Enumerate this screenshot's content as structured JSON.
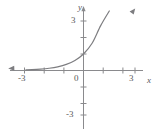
{
  "figure": {
    "name": "exponential-growth-graph",
    "background_color": "#ffffff",
    "curve_color": "#7d7d80",
    "axis_color": "#8a8a8d",
    "text_color": "#58585a"
  },
  "axes": {
    "x_axis_label": "x",
    "y_axis_label": "y",
    "origin_label": "0",
    "x_ticks": [
      {
        "value": -3,
        "label": "-3",
        "labeled": true
      },
      {
        "value": -2,
        "label": "",
        "labeled": false
      },
      {
        "value": -1,
        "label": "",
        "labeled": false
      },
      {
        "value": 1,
        "label": "",
        "labeled": false
      },
      {
        "value": 2,
        "label": "",
        "labeled": false
      },
      {
        "value": 3,
        "label": "3",
        "labeled": true
      }
    ],
    "y_ticks": [
      {
        "value": 3,
        "label": "3",
        "labeled": true
      },
      {
        "value": 2,
        "label": "",
        "labeled": false
      },
      {
        "value": 1,
        "label": "",
        "labeled": false
      },
      {
        "value": -1,
        "label": "",
        "labeled": false
      },
      {
        "value": -2,
        "label": "",
        "labeled": false
      },
      {
        "value": -3,
        "label": "-3",
        "labeled": true
      }
    ]
  },
  "chart_data": {
    "type": "line",
    "title": "",
    "subtitle": "",
    "xlabel": "x",
    "ylabel": "y",
    "xlim": [
      -3.6,
      3.6
    ],
    "ylim": [
      -3.6,
      3.6
    ],
    "grid": false,
    "legend": null,
    "xticks": [
      -3,
      -2,
      -1,
      0,
      1,
      2,
      3
    ],
    "xticklabels": [
      "-3",
      "",
      "",
      "0",
      "",
      "",
      "3"
    ],
    "yticks": [
      -3,
      -2,
      -1,
      0,
      1,
      2,
      3
    ],
    "yticklabels": [
      "-3",
      "",
      "",
      "0",
      "",
      "",
      "3"
    ],
    "series": [
      {
        "name": "y = e^x",
        "color": "#7d7d80",
        "line_width": 1.2,
        "arrow_start": true,
        "arrow_end": true,
        "x": [
          -3.35,
          -3.0,
          -2.5,
          -2.0,
          -1.5,
          -1.0,
          -0.5,
          0.0,
          0.5,
          1.0,
          1.5,
          2.0,
          2.25
        ],
        "y": [
          0.035,
          0.05,
          0.082,
          0.135,
          0.223,
          0.368,
          0.607,
          1.0,
          1.649,
          2.718,
          4.48,
          7.39,
          9.49
        ],
        "annotations": []
      }
    ]
  }
}
